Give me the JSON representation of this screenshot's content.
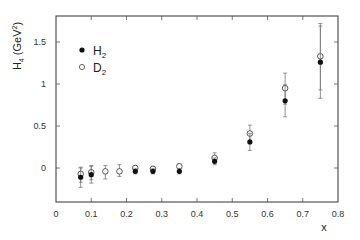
{
  "chart_data": {
    "type": "scatter",
    "title": "",
    "xlabel": "x",
    "ylabel": "H4 (GeV²)",
    "ylabel_main": "H",
    "ylabel_sub": "4",
    "ylabel_unit": "(GeV",
    "ylabel_sup": "2",
    "ylabel_close": ")",
    "xlim": [
      0,
      0.8
    ],
    "ylim": [
      -0.4,
      1.81
    ],
    "x_ticks": [
      0,
      0.1,
      0.2,
      0.3,
      0.4,
      0.5,
      0.6,
      0.7,
      0.8
    ],
    "x_tick_labels": [
      "0",
      "0.1",
      "0.2",
      "0.3",
      "0.4",
      "0.5",
      "0.6",
      "0.7",
      "0.8"
    ],
    "y_ticks": [
      0,
      0.5,
      1,
      1.5
    ],
    "y_tick_labels": [
      "0",
      "0.5",
      "1",
      "1.5"
    ],
    "grid": false,
    "legend_position": "upper left",
    "series": [
      {
        "name": "H2",
        "label_main": "H",
        "label_sub": "2",
        "marker": "filled-circle",
        "color": "#111111",
        "points": [
          {
            "x": 0.07,
            "y": -0.11,
            "err_low": -0.23,
            "err_high": 0.0
          },
          {
            "x": 0.1,
            "y": -0.08,
            "err_low": -0.18,
            "err_high": 0.02
          },
          {
            "x": 0.225,
            "y": -0.04,
            "err_low": -0.07,
            "err_high": -0.01
          },
          {
            "x": 0.275,
            "y": -0.04,
            "err_low": -0.07,
            "err_high": -0.01
          },
          {
            "x": 0.35,
            "y": -0.04,
            "err_low": -0.07,
            "err_high": -0.01
          },
          {
            "x": 0.45,
            "y": 0.08,
            "err_low": 0.04,
            "err_high": 0.12
          },
          {
            "x": 0.55,
            "y": 0.31,
            "err_low": 0.21,
            "err_high": 0.41
          },
          {
            "x": 0.65,
            "y": 0.8,
            "err_low": 0.61,
            "err_high": 0.99
          },
          {
            "x": 0.75,
            "y": 1.26,
            "err_low": 0.83,
            "err_high": 1.69
          }
        ]
      },
      {
        "name": "D2",
        "label_main": "D",
        "label_sub": "2",
        "marker": "open-circle",
        "color": "#111111",
        "points": [
          {
            "x": 0.07,
            "y": -0.07,
            "err_low": -0.17,
            "err_high": 0.01
          },
          {
            "x": 0.1,
            "y": -0.05,
            "err_low": -0.14,
            "err_high": 0.03
          },
          {
            "x": 0.14,
            "y": -0.04,
            "err_low": -0.13,
            "err_high": 0.03
          },
          {
            "x": 0.18,
            "y": -0.04,
            "err_low": -0.1,
            "err_high": 0.04
          },
          {
            "x": 0.225,
            "y": 0.0,
            "err_low": -0.03,
            "err_high": 0.03
          },
          {
            "x": 0.275,
            "y": -0.01,
            "err_low": -0.04,
            "err_high": 0.02
          },
          {
            "x": 0.35,
            "y": 0.02,
            "err_low": -0.01,
            "err_high": 0.05
          },
          {
            "x": 0.45,
            "y": 0.12,
            "err_low": 0.06,
            "err_high": 0.18
          },
          {
            "x": 0.55,
            "y": 0.41,
            "err_low": 0.31,
            "err_high": 0.51
          },
          {
            "x": 0.65,
            "y": 0.95,
            "err_low": 0.76,
            "err_high": 1.13
          },
          {
            "x": 0.75,
            "y": 1.33,
            "err_low": 0.93,
            "err_high": 1.72
          }
        ]
      }
    ]
  }
}
